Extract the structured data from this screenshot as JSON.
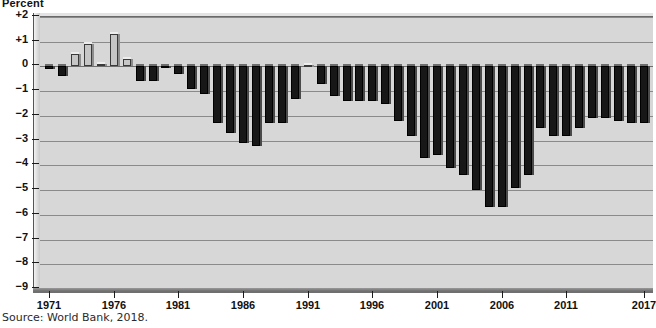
{
  "chart_data": {
    "type": "bar",
    "title": "Percent",
    "ylabel": "Percent",
    "xlabel": "",
    "source": "Source: World Bank, 2018.",
    "ylim": [
      -9,
      2
    ],
    "grid": true,
    "legend": "none",
    "y_ticks": [
      "+2",
      "+1",
      "0",
      "-1",
      "-2",
      "-3",
      "-4",
      "-5",
      "-6",
      "-7",
      "-8",
      "-9"
    ],
    "y_tick_values": [
      2,
      1,
      0,
      -1,
      -2,
      -3,
      -4,
      -5,
      -6,
      -7,
      -8,
      -9
    ],
    "x_ticks": [
      "1971",
      "1976",
      "1981",
      "1986",
      "1991",
      "1996",
      "2001",
      "2006",
      "2011",
      "2017"
    ],
    "x_tick_values": [
      1971,
      1976,
      1981,
      1986,
      1991,
      1996,
      2001,
      2006,
      2011,
      2017
    ],
    "xlim": [
      1970.3,
      2017.7
    ],
    "categories": [
      1971,
      1972,
      1973,
      1974,
      1975,
      1976,
      1977,
      1978,
      1979,
      1980,
      1981,
      1982,
      1983,
      1984,
      1985,
      1986,
      1987,
      1988,
      1989,
      1990,
      1991,
      1992,
      1993,
      1994,
      1995,
      1996,
      1997,
      1998,
      1999,
      2000,
      2001,
      2002,
      2003,
      2004,
      2005,
      2006,
      2007,
      2008,
      2009,
      2010,
      2011,
      2012,
      2013,
      2014,
      2015,
      2016,
      2017
    ],
    "values": [
      -0.1,
      -0.4,
      0.5,
      0.9,
      0.1,
      1.3,
      0.3,
      -0.6,
      -0.6,
      -0.05,
      -0.3,
      -0.9,
      -1.1,
      -2.3,
      -2.7,
      -3.1,
      -3.2,
      -2.3,
      -2.3,
      -1.3,
      0.05,
      -0.7,
      -1.2,
      -1.4,
      -1.4,
      -1.4,
      -1.5,
      -2.2,
      -2.8,
      -3.7,
      -3.6,
      -4.1,
      -4.4,
      -5.0,
      -5.7,
      -5.7,
      -4.9,
      -4.4,
      -2.5,
      -2.8,
      -2.8,
      -2.5,
      -2.1,
      -2.1,
      -2.2,
      -2.3,
      -2.3
    ],
    "colors": {
      "negative_bar": "#171717",
      "positive_bar": "#c6c6c6",
      "plot_background": "#d7d7d7",
      "gridline": "#8a8a8a",
      "text": "#111111",
      "page_background": "#ffffff"
    }
  }
}
